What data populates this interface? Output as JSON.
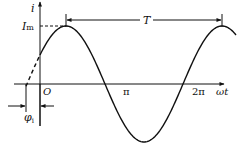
{
  "diagram": {
    "type": "sinusoid",
    "axis_labels": {
      "y": "i",
      "x": "ωt",
      "origin": "O"
    },
    "amplitude_label": {
      "main": "I",
      "sub": "m"
    },
    "period_label": "T",
    "phase_label": {
      "main": "φ",
      "sub": "i"
    },
    "ticks": [
      {
        "label": "π"
      },
      {
        "label": "2π"
      }
    ],
    "colors": {
      "stroke": "#111111",
      "background": "#ffffff"
    }
  }
}
